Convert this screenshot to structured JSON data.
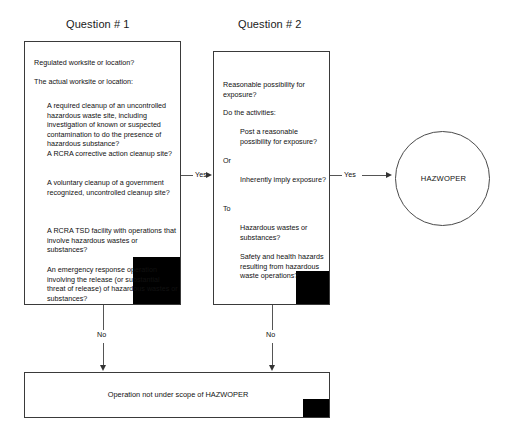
{
  "diagram": {
    "headings": [
      {
        "id": "q1",
        "label": "Question # 1"
      },
      {
        "id": "q2",
        "label": "Question # 2"
      }
    ],
    "question1": {
      "lead1": "Regulated worksite or location?",
      "lead2": "The actual worksite or location:",
      "items": [
        "A required cleanup of an uncontrolled hazardous waste site, including investigation of known or suspected contamination to do the presence of hazardous substance?",
        "A RCRA corrective action cleanup site?",
        "A voluntary cleanup of a government recognized, uncontrolled cleanup site?",
        "A RCRA TSD facility with operations that involve hazardous wastes or substances?",
        "An emergency response operation involving the release (or substantial threat of release) of hazardous wastes or substances?"
      ]
    },
    "question2": {
      "lead1": "Reasonable possibility for exposure?",
      "lead2": "Do the activities:",
      "item1": "Post a reasonable possibility for exposure?",
      "conj_or": "Or",
      "item2": "Inherently imply exposure?",
      "conj_to": "To",
      "item3": "Hazardous wastes or substances?",
      "item4": "Safety and health hazards resulting from hazardous waste operations?"
    },
    "terminal_circle": {
      "label": "HAZWOPER"
    },
    "terminal_box": {
      "label": "Operation not under scope of HAZWOPER"
    },
    "edges": {
      "yes1": "Yes",
      "yes2": "Yes",
      "no1": "No",
      "no2": "No"
    },
    "colors": {
      "background": "#ffffff",
      "stroke": "#3a3a3a",
      "connector": "#555555",
      "corner_fill": "#000000",
      "text": "#111111"
    }
  }
}
